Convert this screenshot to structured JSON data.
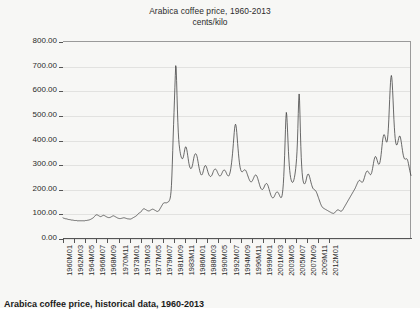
{
  "chart_data": {
    "type": "line",
    "title": "Arabica coffee price, 1960-2013",
    "subtitle": "cents/kilo",
    "xlabel": "",
    "ylabel": "",
    "ylim": [
      0,
      800
    ],
    "yticks": [
      "0.00",
      "100.00",
      "200.00",
      "300.00",
      "400.00",
      "500.00",
      "600.00",
      "700.00",
      "800.00"
    ],
    "ytick_values": [
      0,
      100,
      200,
      300,
      400,
      500,
      600,
      700,
      800
    ],
    "grid": "horizontal",
    "legend": "none",
    "line_color": "#3a3a3a",
    "background_color": "#f7f7f5",
    "grid_color": "#e2e2e0",
    "axis_color": "#555555",
    "xtick_labels": [
      "1960M01",
      "1962M03",
      "1964M05",
      "1966M07",
      "1968M09",
      "1970M11",
      "1973M01",
      "1975M03",
      "1977M05",
      "1979M07",
      "1981M09",
      "1983M11",
      "1986M01",
      "1988M03",
      "1990M05",
      "1992M07",
      "1994M09",
      "1996M11",
      "1999M01",
      "2001M03",
      "2003M05",
      "2005M07",
      "2007M09",
      "2009M11",
      "2012M01"
    ],
    "x_start": "1960M01",
    "x_end": "2013M12",
    "n_points": 648,
    "series": [
      {
        "name": "Arabica coffee price",
        "unit": "cents/kilo",
        "values": [
          82,
          81,
          80,
          80,
          79,
          79,
          78,
          78,
          78,
          77,
          77,
          76,
          76,
          75,
          75,
          75,
          74,
          74,
          74,
          73,
          73,
          73,
          73,
          72,
          72,
          72,
          72,
          71,
          71,
          71,
          71,
          71,
          71,
          70,
          70,
          70,
          70,
          70,
          70,
          70,
          70,
          70,
          70,
          70,
          70,
          70,
          70,
          70,
          70,
          70,
          70,
          70,
          71,
          71,
          71,
          71,
          72,
          72,
          72,
          72,
          73,
          73,
          74,
          74,
          75,
          76,
          77,
          78,
          79,
          80,
          81,
          82,
          84,
          86,
          88,
          90,
          92,
          93,
          94,
          94,
          94,
          93,
          92,
          91,
          90,
          89,
          88,
          87,
          87,
          87,
          88,
          89,
          90,
          91,
          92,
          92,
          92,
          91,
          90,
          89,
          88,
          87,
          86,
          85,
          84,
          84,
          83,
          83,
          83,
          83,
          83,
          84,
          85,
          86,
          87,
          88,
          89,
          90,
          90,
          90,
          89,
          88,
          87,
          86,
          85,
          84,
          83,
          82,
          81,
          80,
          80,
          79,
          79,
          79,
          79,
          79,
          79,
          80,
          80,
          81,
          81,
          82,
          82,
          82,
          82,
          81,
          81,
          80,
          80,
          79,
          79,
          78,
          78,
          78,
          77,
          77,
          77,
          77,
          77,
          77,
          78,
          79,
          80,
          81,
          82,
          83,
          84,
          85,
          86,
          87,
          88,
          89,
          90,
          92,
          94,
          96,
          98,
          100,
          101,
          102,
          103,
          104,
          105,
          107,
          109,
          112,
          114,
          116,
          118,
          119,
          119,
          118,
          117,
          116,
          115,
          114,
          113,
          112,
          111,
          110,
          110,
          110,
          110,
          111,
          112,
          113,
          114,
          115,
          116,
          117,
          117,
          117,
          116,
          115,
          114,
          113,
          112,
          111,
          110,
          109,
          108,
          108,
          108,
          109,
          110,
          112,
          115,
          118,
          121,
          124,
          127,
          130,
          133,
          136,
          139,
          141,
          142,
          143,
          143,
          143,
          143,
          143,
          143,
          143,
          144,
          145,
          146,
          147,
          149,
          152,
          156,
          162,
          172,
          188,
          214,
          252,
          300,
          355,
          410,
          460,
          510,
          560,
          610,
          660,
          700,
          690,
          640,
          580,
          520,
          470,
          430,
          400,
          380,
          365,
          352,
          342,
          334,
          328,
          324,
          322,
          322,
          325,
          330,
          338,
          348,
          358,
          366,
          370,
          370,
          366,
          358,
          348,
          336,
          324,
          312,
          302,
          294,
          288,
          284,
          282,
          282,
          284,
          288,
          294,
          302,
          312,
          322,
          330,
          336,
          340,
          342,
          342,
          340,
          336,
          330,
          322,
          312,
          302,
          292,
          283,
          275,
          268,
          262,
          258,
          256,
          256,
          258,
          262,
          268,
          275,
          282,
          288,
          292,
          294,
          294,
          292,
          288,
          283,
          277,
          271,
          265,
          260,
          256,
          253,
          251,
          250,
          250,
          251,
          253,
          256,
          260,
          265,
          270,
          274,
          277,
          279,
          280,
          280,
          279,
          277,
          274,
          270,
          266,
          262,
          258,
          255,
          253,
          252,
          252,
          253,
          255,
          258,
          262,
          266,
          270,
          273,
          275,
          276,
          276,
          275,
          273,
          270,
          266,
          262,
          258,
          255,
          253,
          252,
          252,
          254,
          258,
          264,
          272,
          282,
          294,
          308,
          324,
          342,
          362,
          384,
          406,
          428,
          446,
          458,
          462,
          458,
          446,
          428,
          406,
          384,
          362,
          342,
          324,
          308,
          295,
          285,
          278,
          273,
          270,
          269,
          269,
          270,
          272,
          274,
          276,
          277,
          277,
          276,
          274,
          271,
          267,
          262,
          257,
          252,
          247,
          242,
          238,
          234,
          231,
          229,
          228,
          228,
          229,
          231,
          234,
          238,
          242,
          246,
          250,
          253,
          255,
          256,
          256,
          254,
          251,
          247,
          242,
          236,
          230,
          224,
          218,
          212,
          207,
          203,
          200,
          198,
          197,
          197,
          198,
          200,
          203,
          207,
          211,
          215,
          218,
          220,
          221,
          221,
          220,
          217,
          213,
          208,
          202,
          196,
          190,
          184,
          178,
          173,
          169,
          166,
          164,
          163,
          163,
          164,
          166,
          169,
          173,
          177,
          181,
          184,
          186,
          187,
          187,
          186,
          184,
          181,
          177,
          173,
          169,
          166,
          164,
          164,
          166,
          172,
          182,
          198,
          220,
          250,
          288,
          334,
          386,
          440,
          486,
          510,
          500,
          470,
          430,
          390,
          352,
          320,
          294,
          274,
          258,
          246,
          238,
          232,
          228,
          226,
          226,
          228,
          232,
          238,
          246,
          256,
          268,
          282,
          300,
          322,
          350,
          390,
          444,
          506,
          560,
          585,
          560,
          500,
          430,
          372,
          326,
          292,
          266,
          248,
          235,
          227,
          222,
          220,
          220,
          222,
          226,
          232,
          240,
          248,
          254,
          258,
          260,
          259,
          256,
          251,
          245,
          238,
          231,
          224,
          218,
          212,
          207,
          203,
          200,
          198,
          197,
          196,
          195,
          193,
          191,
          188,
          184,
          180,
          175,
          170,
          165,
          160,
          155,
          150,
          145,
          140,
          136,
          132,
          129,
          126,
          124,
          122,
          121,
          120,
          119,
          118,
          117,
          116,
          115,
          114,
          113,
          112,
          111,
          110,
          109,
          108,
          107,
          106,
          105,
          104,
          103,
          102,
          101,
          101,
          100,
          100,
          100,
          101,
          102,
          104,
          106,
          108,
          110,
          112,
          113,
          114,
          114,
          114,
          113,
          112,
          111,
          110,
          109,
          109,
          109,
          110,
          112,
          114,
          117,
          120,
          123,
          126,
          129,
          132,
          135,
          138,
          141,
          144,
          147,
          150,
          153,
          156,
          159,
          162,
          165,
          168,
          171,
          174,
          177,
          180,
          183,
          186,
          189,
          192,
          195,
          198,
          201,
          205,
          209,
          213,
          217,
          221,
          225,
          228,
          231,
          233,
          234,
          234,
          233,
          231,
          229,
          227,
          226,
          226,
          228,
          231,
          235,
          240,
          246,
          252,
          258,
          263,
          267,
          270,
          272,
          272,
          271,
          269,
          266,
          263,
          260,
          258,
          257,
          258,
          261,
          266,
          273,
          282,
          292,
          302,
          312,
          320,
          326,
          330,
          331,
          329,
          325,
          320,
          314,
          308,
          303,
          300,
          299,
          301,
          306,
          314,
          325,
          339,
          355,
          372,
          388,
          402,
          412,
          418,
          420,
          418,
          413,
          406,
          398,
          392,
          389,
          392,
          402,
          420,
          446,
          480,
          520,
          562,
          600,
          632,
          652,
          660,
          652,
          630,
          598,
          560,
          520,
          482,
          450,
          424,
          404,
          390,
          382,
          378,
          378,
          382,
          388,
          396,
          404,
          410,
          414,
          414,
          410,
          402,
          392,
          380,
          368,
          356,
          345,
          336,
          329,
          324,
          321,
          320,
          320,
          321,
          322,
          322,
          320,
          316,
          310,
          302,
          293,
          284,
          275,
          267,
          260,
          254
        ]
      }
    ]
  },
  "caption": {
    "text": "Arabica coffee price, historical data, 1960-2013"
  }
}
